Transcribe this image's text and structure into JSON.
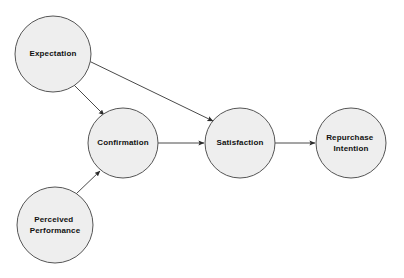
{
  "diagram": {
    "background_color": "#ffffff",
    "node_fill_color": "#eeeeee",
    "node_stroke_color": "#555555",
    "edge_color": "#4a4a4a",
    "label_color": "#111111",
    "nodes": [
      {
        "id": "expectation",
        "label": "Expectation",
        "lines": [
          "Expectation"
        ],
        "cx": 53,
        "cy": 54,
        "r": 38
      },
      {
        "id": "perceived-performance",
        "label": "Perceived Performance",
        "lines": [
          "Perceived",
          "Performance"
        ],
        "cx": 55,
        "cy": 225,
        "r": 38
      },
      {
        "id": "confirmation",
        "label": "Confirmation",
        "lines": [
          "Confirmation"
        ],
        "cx": 123,
        "cy": 143,
        "r": 35
      },
      {
        "id": "satisfaction",
        "label": "Satisfaction",
        "lines": [
          "Satisfaction"
        ],
        "cx": 240,
        "cy": 143,
        "r": 35
      },
      {
        "id": "repurchase-intention",
        "label": "Repurchase Intention",
        "lines": [
          "Repurchase",
          "Intention"
        ],
        "cx": 351,
        "cy": 143,
        "r": 35
      }
    ],
    "edges": [
      {
        "id": "expectation-to-confirmation",
        "from": "expectation",
        "to": "confirmation",
        "from_label": "Expectation",
        "to_label": "Confirmation",
        "x1": 74,
        "y1": 85,
        "x2": 104,
        "y2": 115
      },
      {
        "id": "expectation-to-satisfaction",
        "from": "expectation",
        "to": "satisfaction",
        "from_label": "Expectation",
        "to_label": "Satisfaction",
        "x1": 89,
        "y1": 61,
        "x2": 213,
        "y2": 121
      },
      {
        "id": "perceived-performance-to-confirmation",
        "from": "perceived-performance",
        "to": "confirmation",
        "from_label": "Perceived Performance",
        "to_label": "Confirmation",
        "x1": 76,
        "y1": 194,
        "x2": 100,
        "y2": 171
      },
      {
        "id": "confirmation-to-satisfaction",
        "from": "confirmation",
        "to": "satisfaction",
        "from_label": "Confirmation",
        "to_label": "Satisfaction",
        "x1": 158,
        "y1": 143,
        "x2": 204,
        "y2": 143
      },
      {
        "id": "satisfaction-to-repurchase-intention",
        "from": "satisfaction",
        "to": "repurchase-intention",
        "from_label": "Satisfaction",
        "to_label": "Repurchase Intention",
        "x1": 275,
        "y1": 143,
        "x2": 315,
        "y2": 143
      }
    ]
  }
}
